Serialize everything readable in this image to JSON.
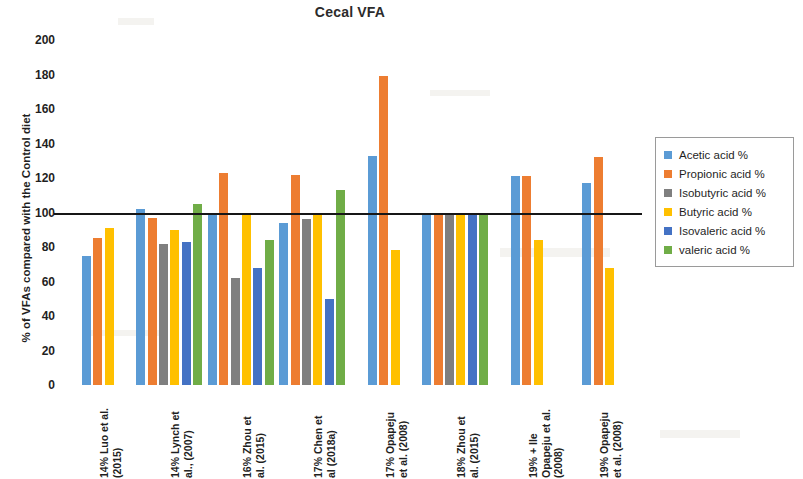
{
  "chart_data": {
    "type": "bar",
    "title": "Cecal VFA",
    "xlabel": "",
    "ylabel": "% of VFAs compared with the Control diet",
    "ylim": [
      0,
      200
    ],
    "ytick_step": 20,
    "yticks": [
      200,
      180,
      160,
      140,
      120,
      100,
      80,
      60,
      40,
      20,
      0
    ],
    "grid": false,
    "legend_position": "right",
    "reference_line": 100,
    "categories": [
      "14% Luo et al. (2015)",
      "14% Lynch et al., (2007)",
      "16% Zhou et al. (2015)",
      "17% Chen et al (2018a)",
      "17% Opapeju et al. (2008)",
      "18% Zhou et al. (2015)",
      "19% + Ile Opapeju et al. (2008)",
      "19% Opapeju et al. (2008)"
    ],
    "series": [
      {
        "name": "Acetic acid  %",
        "color": "#5B9BD5",
        "values": [
          75,
          102,
          100,
          94,
          133,
          100,
          121,
          117
        ]
      },
      {
        "name": "Propionic acid  %",
        "color": "#ED7D31",
        "values": [
          85,
          97,
          123,
          122,
          179,
          100,
          121,
          132
        ]
      },
      {
        "name": "Isobutyric acid  %",
        "color": "#7F7F7F",
        "values": [
          null,
          82,
          62,
          96,
          null,
          100,
          null,
          null
        ]
      },
      {
        "name": "Butyric acid  %",
        "color": "#FFC000",
        "values": [
          91,
          90,
          100,
          100,
          78,
          100,
          84,
          68
        ]
      },
      {
        "name": "Isovaleric acid  %",
        "color": "#4472C4",
        "values": [
          null,
          83,
          68,
          50,
          null,
          100,
          null,
          null
        ]
      },
      {
        "name": "valeric acid  %",
        "color": "#70AD47",
        "values": [
          null,
          105,
          84,
          113,
          null,
          100,
          null,
          null
        ]
      }
    ]
  },
  "legend": {
    "items": [
      {
        "label": "Acetic acid  %",
        "color": "#5B9BD5"
      },
      {
        "label": "Propionic acid  %",
        "color": "#ED7D31"
      },
      {
        "label": "Isobutyric acid  %",
        "color": "#7F7F7F"
      },
      {
        "label": "Butyric acid  %",
        "color": "#FFC000"
      },
      {
        "label": "Isovaleric acid  %",
        "color": "#4472C4"
      },
      {
        "label": "valeric acid  %",
        "color": "#70AD47"
      }
    ]
  },
  "x_label_lines": [
    "14% Luo et al.\n(2015)",
    "14% Lynch et\nal., (2007)",
    "16% Zhou et\nal. (2015)",
    "17% Chen et\nal (2018a)",
    "17% Opapeju\net al. (2008)",
    "18% Zhou et\nal. (2015)",
    "19% + Ile\nOpapeju et al.\n(2008)",
    "19% Opapeju\net al. (2008)"
  ]
}
